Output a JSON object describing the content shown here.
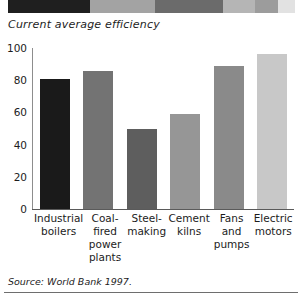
{
  "chart_data": {
    "type": "bar",
    "title": "Current average efficiency",
    "xlabel": "",
    "ylabel": "",
    "ylim": [
      0,
      100
    ],
    "yticks": [
      100,
      80,
      60,
      40,
      20,
      0
    ],
    "grid": false,
    "legend": "none",
    "categories": [
      "Industrial boilers",
      "Coal-fired power plants",
      "Steel-making",
      "Cement kilns",
      "Fans and pumps",
      "Electric motors"
    ],
    "values": [
      81,
      86,
      50,
      59,
      89,
      96
    ],
    "bar_colors": [
      "#1a1a1a",
      "#737373",
      "#5e5e5e",
      "#969696",
      "#8a8a8a",
      "#c8c8c8"
    ],
    "source": "Source: World Bank 1997."
  },
  "banner": {
    "segments": [
      {
        "color": "#ffffff",
        "width": 8
      },
      {
        "color": "#1f1f1f",
        "width": 82
      },
      {
        "color": "#a3a3a3",
        "width": 65
      },
      {
        "color": "#6b6b6b",
        "width": 68
      },
      {
        "color": "#b5b5b5",
        "width": 32
      },
      {
        "color": "#9c9c9c",
        "width": 23
      },
      {
        "color": "#e2e2e2",
        "width": 17
      },
      {
        "color": "#ffffff",
        "width": 7
      }
    ]
  }
}
